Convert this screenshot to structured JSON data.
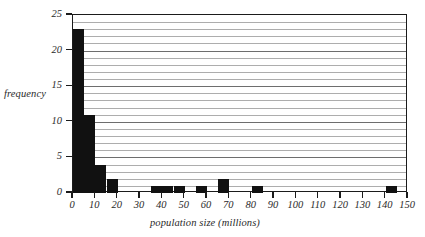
{
  "chart_data": {
    "type": "bar",
    "title": "",
    "xlabel": "population size (millions)",
    "ylabel": "frequency",
    "xlim": [
      0,
      150
    ],
    "ylim": [
      0,
      25
    ],
    "xtick_labels": [
      "0",
      "10",
      "20",
      "30",
      "40",
      "50",
      "60",
      "70",
      "80",
      "90",
      "100",
      "110",
      "120",
      "130",
      "140",
      "150"
    ],
    "xtick_values": [
      0,
      10,
      20,
      30,
      40,
      50,
      60,
      70,
      80,
      90,
      100,
      110,
      120,
      130,
      140,
      150
    ],
    "ytick_labels": [
      "0",
      "5",
      "10",
      "15",
      "20",
      "25"
    ],
    "ytick_values": [
      0,
      5,
      10,
      15,
      20,
      25
    ],
    "grid": true,
    "grid_axis": "y",
    "grid_step": 1,
    "grid_major_step": 5,
    "bin_width": 5,
    "bin_edges": [
      0,
      5,
      10,
      15,
      20,
      25,
      30,
      35,
      40,
      45,
      50,
      55,
      60,
      65,
      70,
      75,
      80,
      85,
      90,
      95,
      100,
      105,
      110,
      115,
      120,
      125,
      130,
      135,
      140,
      145,
      150
    ],
    "bins": [
      {
        "x0": 0,
        "x1": 5,
        "value": 23
      },
      {
        "x0": 5,
        "x1": 10,
        "value": 11
      },
      {
        "x0": 10,
        "x1": 15,
        "value": 4
      },
      {
        "x0": 15,
        "x1": 20,
        "value": 2
      },
      {
        "x0": 20,
        "x1": 25,
        "value": 0
      },
      {
        "x0": 25,
        "x1": 30,
        "value": 0
      },
      {
        "x0": 30,
        "x1": 35,
        "value": 0
      },
      {
        "x0": 35,
        "x1": 40,
        "value": 1
      },
      {
        "x0": 40,
        "x1": 45,
        "value": 1
      },
      {
        "x0": 45,
        "x1": 50,
        "value": 1
      },
      {
        "x0": 50,
        "x1": 55,
        "value": 0
      },
      {
        "x0": 55,
        "x1": 60,
        "value": 1
      },
      {
        "x0": 60,
        "x1": 65,
        "value": 0
      },
      {
        "x0": 65,
        "x1": 70,
        "value": 2
      },
      {
        "x0": 70,
        "x1": 75,
        "value": 0
      },
      {
        "x0": 75,
        "x1": 80,
        "value": 0
      },
      {
        "x0": 80,
        "x1": 85,
        "value": 1
      },
      {
        "x0": 85,
        "x1": 90,
        "value": 0
      },
      {
        "x0": 90,
        "x1": 95,
        "value": 0
      },
      {
        "x0": 95,
        "x1": 100,
        "value": 0
      },
      {
        "x0": 100,
        "x1": 105,
        "value": 0
      },
      {
        "x0": 105,
        "x1": 110,
        "value": 0
      },
      {
        "x0": 110,
        "x1": 115,
        "value": 0
      },
      {
        "x0": 115,
        "x1": 120,
        "value": 0
      },
      {
        "x0": 120,
        "x1": 125,
        "value": 0
      },
      {
        "x0": 125,
        "x1": 130,
        "value": 0
      },
      {
        "x0": 130,
        "x1": 135,
        "value": 0
      },
      {
        "x0": 135,
        "x1": 140,
        "value": 0
      },
      {
        "x0": 140,
        "x1": 145,
        "value": 1
      },
      {
        "x0": 145,
        "x1": 150,
        "value": 0
      }
    ],
    "colors": {
      "bar": "#111111",
      "grid_minor": "#adadad",
      "grid_major": "#6e6e6e",
      "axis": "#1b1b1b",
      "background": "#ffffff",
      "text": "#2a2a2a"
    }
  }
}
